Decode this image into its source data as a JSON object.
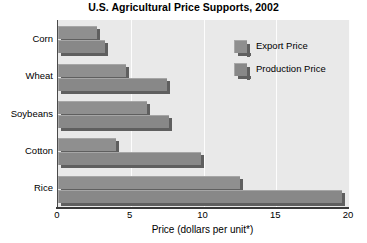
{
  "chart_data": {
    "type": "bar",
    "orientation": "horizontal",
    "title": "U.S. Agricultural Price Supports, 2002",
    "xlabel": "Price (dollars per unit*)",
    "ylabel": "",
    "categories": [
      "Corn",
      "Wheat",
      "Soybeans",
      "Cotton",
      "Rice"
    ],
    "series": [
      {
        "name": "Export Price",
        "color": "#8f8f8f",
        "values": [
          2.7,
          4.7,
          6.1,
          4.0,
          12.5
        ]
      },
      {
        "name": "Production Price",
        "color": "#888888",
        "values": [
          3.2,
          7.5,
          7.6,
          9.8,
          19.5
        ]
      }
    ],
    "xlim": [
      0,
      20
    ],
    "xticks": [
      "0",
      "5",
      "10",
      "15",
      "20"
    ],
    "xtick_values": [
      0,
      5,
      10,
      15,
      20
    ],
    "grid": true,
    "grid_axis": "x",
    "legend_position": "top-right",
    "plot_background": "#e9e9e9",
    "gridline_color": "#fdfdfd",
    "axis_color": "#3a3a3a"
  }
}
